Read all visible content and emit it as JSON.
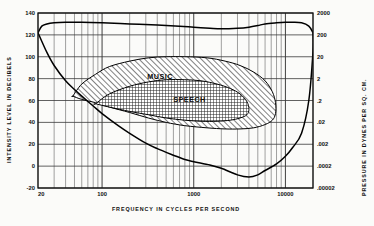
{
  "chart_data": {
    "type": "area",
    "title": "",
    "subtitle": "",
    "xlabel": "FREQUENCY  IN  CYCLES  PER  SECOND",
    "ylabel": "INTENSITY  LEVEL  IN  DECIBELS",
    "y2label": "PRESSURE  IN  DYNES  PER  SQ. CM.",
    "xscale": "log",
    "xlim": [
      20,
      20000
    ],
    "ylim": [
      -20,
      140
    ],
    "grid": true,
    "grid_minor": true,
    "legend": "none",
    "xticks": [
      20,
      100,
      1000,
      10000
    ],
    "xtick_labels": [
      "20",
      "100",
      "1000",
      "10000"
    ],
    "yticks": [
      -20,
      0,
      20,
      40,
      60,
      80,
      100,
      120,
      140
    ],
    "ytick_labels": [
      "-20",
      "0",
      "20",
      "40",
      "60",
      "80",
      "100",
      "120",
      "140"
    ],
    "y2ticks": [
      -20,
      0,
      20,
      40,
      60,
      80,
      100,
      120,
      140
    ],
    "y2tick_labels": [
      ".00002",
      ".0002",
      ".002",
      ".02",
      ".2",
      "2",
      "20",
      "200",
      "2000"
    ],
    "series": [
      {
        "name": "threshold-of-feeling",
        "kind": "line",
        "description": "Upper boundary of the auditory area (threshold of feeling / pain)",
        "points": [
          [
            20,
            122
          ],
          [
            22,
            128
          ],
          [
            25,
            130
          ],
          [
            30,
            131
          ],
          [
            40,
            131.5
          ],
          [
            60,
            131.5
          ],
          [
            100,
            131
          ],
          [
            200,
            130
          ],
          [
            400,
            129
          ],
          [
            700,
            128
          ],
          [
            1000,
            127
          ],
          [
            1500,
            126
          ],
          [
            2000,
            125.5
          ],
          [
            3000,
            126
          ],
          [
            4000,
            127
          ],
          [
            5000,
            128.5
          ],
          [
            6000,
            130
          ],
          [
            8000,
            131
          ],
          [
            10000,
            131.5
          ],
          [
            12000,
            131.5
          ],
          [
            15000,
            131
          ],
          [
            18000,
            128
          ],
          [
            20000,
            122
          ]
        ]
      },
      {
        "name": "threshold-of-hearing",
        "kind": "line",
        "description": "Lower boundary of the auditory area (threshold of audibility)",
        "points": [
          [
            20,
            122
          ],
          [
            25,
            104
          ],
          [
            30,
            92
          ],
          [
            40,
            78
          ],
          [
            50,
            70
          ],
          [
            60,
            64
          ],
          [
            80,
            55
          ],
          [
            100,
            48
          ],
          [
            150,
            37
          ],
          [
            200,
            30
          ],
          [
            300,
            21
          ],
          [
            400,
            16
          ],
          [
            600,
            10
          ],
          [
            800,
            6
          ],
          [
            1000,
            4
          ],
          [
            1500,
            1
          ],
          [
            2000,
            -2
          ],
          [
            3000,
            -8
          ],
          [
            4000,
            -10
          ],
          [
            5000,
            -8
          ],
          [
            6000,
            -4
          ],
          [
            8000,
            2
          ],
          [
            10000,
            9
          ],
          [
            12000,
            17
          ],
          [
            15000,
            30
          ],
          [
            18000,
            60
          ],
          [
            20000,
            105
          ],
          [
            20000,
            122
          ]
        ]
      },
      {
        "name": "music",
        "kind": "region",
        "label": "MUSIC",
        "hatch": "diagonal",
        "description": "Range of frequency and intensity covered by music",
        "points": [
          [
            48,
            64
          ],
          [
            60,
            75
          ],
          [
            85,
            84
          ],
          [
            120,
            91
          ],
          [
            200,
            96
          ],
          [
            320,
            99
          ],
          [
            500,
            100
          ],
          [
            800,
            100
          ],
          [
            1400,
            99
          ],
          [
            2200,
            96
          ],
          [
            3200,
            92
          ],
          [
            4500,
            86
          ],
          [
            6000,
            78
          ],
          [
            7200,
            68
          ],
          [
            7800,
            58
          ],
          [
            7800,
            48
          ],
          [
            7200,
            42
          ],
          [
            6000,
            38
          ],
          [
            4500,
            35
          ],
          [
            3200,
            34
          ],
          [
            2200,
            34
          ],
          [
            1400,
            35
          ],
          [
            800,
            37
          ],
          [
            500,
            40
          ],
          [
            320,
            44
          ],
          [
            200,
            49
          ],
          [
            120,
            54
          ],
          [
            85,
            58
          ],
          [
            60,
            61
          ],
          [
            48,
            64
          ]
        ]
      },
      {
        "name": "speech",
        "kind": "region",
        "label": "SPEECH",
        "hatch": "cross",
        "description": "Range of frequency and intensity covered by speech",
        "points": [
          [
            85,
            57
          ],
          [
            120,
            66
          ],
          [
            200,
            73
          ],
          [
            320,
            77
          ],
          [
            500,
            79
          ],
          [
            800,
            79
          ],
          [
            1200,
            78
          ],
          [
            1800,
            75
          ],
          [
            2500,
            71
          ],
          [
            3200,
            66
          ],
          [
            3800,
            59
          ],
          [
            4000,
            52
          ],
          [
            3800,
            47
          ],
          [
            3200,
            44
          ],
          [
            2500,
            42
          ],
          [
            1800,
            41
          ],
          [
            1200,
            41
          ],
          [
            800,
            42
          ],
          [
            500,
            44
          ],
          [
            320,
            47
          ],
          [
            200,
            50
          ],
          [
            120,
            54
          ],
          [
            85,
            57
          ]
        ]
      }
    ],
    "annotations": [
      {
        "text": "MUSIC",
        "x": 430,
        "y": 80
      },
      {
        "text": "SPEECH",
        "x": 900,
        "y": 59
      }
    ]
  },
  "axes": {
    "left_title": "INTENSITY  LEVEL  IN  DECIBELS",
    "right_title": "PRESSURE  IN  DYNES  PER  SQ. CM.",
    "bottom_title": "FREQUENCY  IN  CYCLES  PER  SECOND"
  },
  "colors": {
    "ink": "#111111",
    "grid": "#4a4a4a",
    "background": "#fbfbf9",
    "curve": "#000000"
  }
}
